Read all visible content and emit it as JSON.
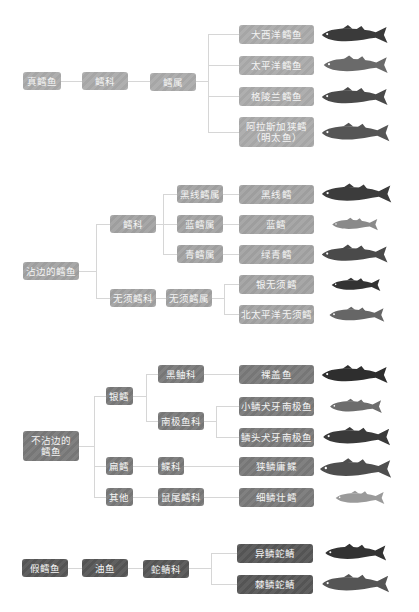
{
  "sections": [
    {
      "root": "真鳕鱼",
      "level1": "鳕科",
      "level2": "鳕属",
      "species": [
        "大西洋鳕鱼",
        "太平洋鳕鱼",
        "格陵兰鳕鱼",
        "阿拉斯加狭鳕\n（明太鱼）"
      ]
    },
    {
      "root": "沾边的鳕鱼",
      "families": [
        {
          "name": "鳕科",
          "genera": [
            {
              "name": "黑线鳕属",
              "species": "黑线鳕"
            },
            {
              "name": "蓝鳕属",
              "species": "蓝鳕"
            },
            {
              "name": "青鳕属",
              "species": "绿青鳕"
            }
          ]
        },
        {
          "name": "无须鳕科",
          "genus": "无须鳕属",
          "species": [
            "银无须鳕",
            "北太平洋无须鳕"
          ]
        }
      ]
    },
    {
      "root": "不沾边的\n鳕鱼",
      "groups": [
        {
          "name": "银鳕",
          "families": [
            {
              "name": "黑鲉科",
              "species": [
                "裸盖鱼"
              ]
            },
            {
              "name": "南极鱼科",
              "species": [
                "小鳞犬牙南极鱼",
                "鳞头犬牙南极鱼"
              ]
            }
          ]
        },
        {
          "name": "扁鳕",
          "family": "鲽科",
          "species": "狭鳞庸鲽"
        },
        {
          "name": "其他",
          "family": "鼠尾鳕科",
          "species": "细鳞壮鳕"
        }
      ]
    },
    {
      "root": "假鳕鱼",
      "level1": "油鱼",
      "level2": "蛇鲭科",
      "species": [
        "异鳞蛇鲭",
        "棘鳞蛇鲭"
      ]
    }
  ],
  "colors": {
    "section1": "#ababab",
    "section2": "#a3a3a3",
    "section3": "#7a7a7a",
    "section4": "#575757",
    "connector": "#d6d6d6"
  }
}
